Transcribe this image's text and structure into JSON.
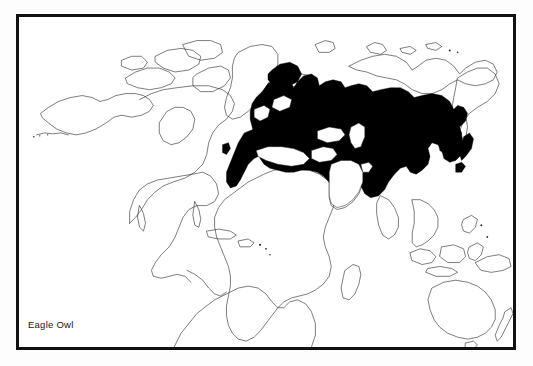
{
  "figure": {
    "kind": "distribution-map",
    "species_label": "Eagle Owl",
    "background_color": "#ffffff",
    "frame_color": "#111111",
    "coastline_color": "#2a2a2a",
    "range_fill_color": "#000000",
    "projection": "world-rectangular"
  },
  "legend": {
    "range_meaning": "Eagle Owl",
    "filled_symbol_label": "Eagle Owl"
  },
  "map_regions": {
    "filled_range_regions": [
      "Europe",
      "Scandinavia",
      "Iberia",
      "North Africa",
      "Middle East",
      "Caucasus",
      "Central Asia",
      "Siberia",
      "Mongolia",
      "China",
      "Korea",
      "Japan",
      "Northern India"
    ],
    "unfilled_regions": [
      "North America",
      "Greenland",
      "Iceland",
      "South America",
      "Sub-Saharan Africa",
      "Madagascar",
      "Arabian Peninsula",
      "Southeast Asia",
      "Indonesia",
      "Philippines",
      "Australia",
      "New Zealand",
      "Arctic Siberian coast",
      "Kamchatka",
      "Alaska"
    ],
    "water_gaps_inside_range": [
      "Mediterranean Sea",
      "Black Sea",
      "Caspian Sea",
      "Baltic Sea",
      "North Sea"
    ]
  }
}
